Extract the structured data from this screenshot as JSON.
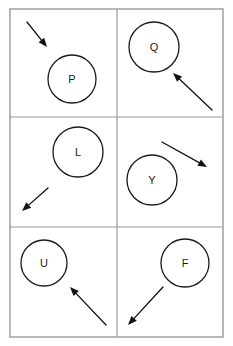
{
  "figure": {
    "title": "",
    "type": "grid-of-circles-with-arrows",
    "width": 233,
    "height": 346,
    "background_color": "#ffffff",
    "grid": {
      "rows": 3,
      "columns": 2,
      "left": 10,
      "top": 9,
      "right": 223,
      "bottom": 337,
      "column_divider_x": 117,
      "row_divider_y": [
        117,
        227
      ],
      "line_color": "#9a9a9a",
      "frame_color": "#9a9a9a"
    },
    "stroke_color": "#1a1a1a",
    "arrow_color": "#111111",
    "label_font_size": 11
  },
  "cells": [
    {
      "id": "cell-1",
      "row": 1,
      "column": 1,
      "label": "P",
      "circle": {
        "cx": 72,
        "cy": 79,
        "r": 24
      },
      "label_pos": {
        "x": 72,
        "y": 79
      },
      "arrow": {
        "from": {
          "x": 27,
          "y": 22
        },
        "to": {
          "x": 47,
          "y": 47
        },
        "direction": "down-right",
        "points_toward_circle": true
      }
    },
    {
      "id": "cell-2",
      "row": 1,
      "column": 2,
      "label": "Q",
      "circle": {
        "cx": 154,
        "cy": 47,
        "r": 25
      },
      "label_pos": {
        "x": 154,
        "y": 47
      },
      "arrow": {
        "from": {
          "x": 212,
          "y": 110
        },
        "to": {
          "x": 173,
          "y": 73
        },
        "direction": "up-left",
        "points_toward_circle": true
      }
    },
    {
      "id": "cell-3",
      "row": 2,
      "column": 1,
      "label": "L",
      "circle": {
        "cx": 78,
        "cy": 152,
        "r": 25
      },
      "label_pos": {
        "x": 78,
        "y": 152
      },
      "arrow": {
        "from": {
          "x": 48,
          "y": 188
        },
        "to": {
          "x": 22,
          "y": 211
        },
        "direction": "down-left",
        "points_toward_circle": false
      }
    },
    {
      "id": "cell-4",
      "row": 2,
      "column": 2,
      "label": "Y",
      "circle": {
        "cx": 152,
        "cy": 180,
        "r": 25
      },
      "label_pos": {
        "x": 152,
        "y": 180
      },
      "arrow": {
        "from": {
          "x": 162,
          "y": 142
        },
        "to": {
          "x": 207,
          "y": 167
        },
        "direction": "down-right",
        "points_toward_circle": false
      }
    },
    {
      "id": "cell-5",
      "row": 3,
      "column": 1,
      "label": "U",
      "circle": {
        "cx": 44,
        "cy": 263,
        "r": 23
      },
      "label_pos": {
        "x": 44,
        "y": 263
      },
      "arrow": {
        "from": {
          "x": 106,
          "y": 325
        },
        "to": {
          "x": 70,
          "y": 287
        },
        "direction": "up-left",
        "points_toward_circle": true
      }
    },
    {
      "id": "cell-6",
      "row": 3,
      "column": 2,
      "label": "F",
      "circle": {
        "cx": 185,
        "cy": 263,
        "r": 24
      },
      "label_pos": {
        "x": 185,
        "y": 263
      },
      "arrow": {
        "from": {
          "x": 163,
          "y": 287
        },
        "to": {
          "x": 128,
          "y": 325
        },
        "direction": "down-left",
        "points_toward_circle": false
      }
    }
  ]
}
